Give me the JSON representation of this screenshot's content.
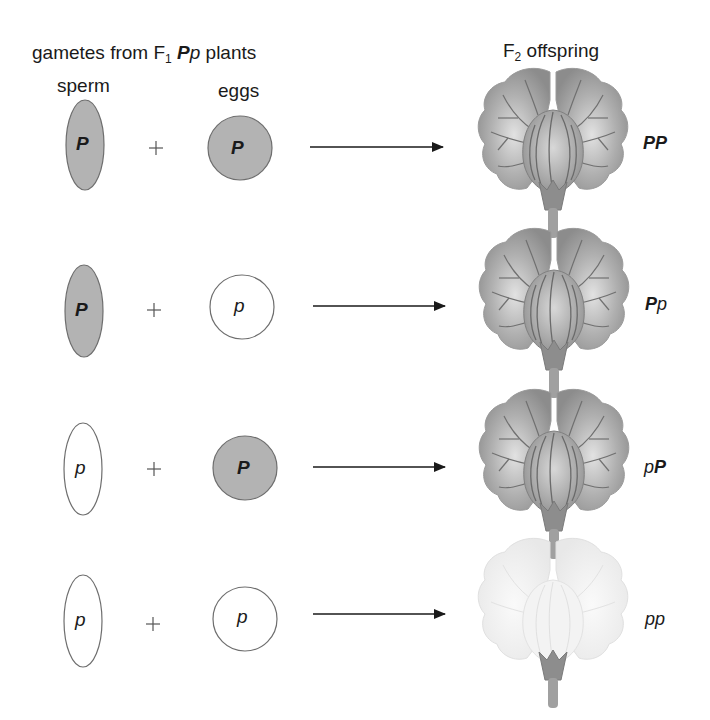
{
  "header": {
    "title_prefix": "gametes from F",
    "title_sub": "1",
    "title_allele_dominant": "P",
    "title_allele_recessive": "p",
    "title_suffix": "plants",
    "sperm_label": "sperm",
    "eggs_label": "eggs",
    "offspring_prefix": "F",
    "offspring_sub": "2",
    "offspring_suffix": "offspring"
  },
  "colors": {
    "dominant_fill": "#b3b3b3",
    "recessive_fill": "#ffffff",
    "outline": "#6e6e6e",
    "purple_flower": "#9a9a9a",
    "white_flower": "#ececec",
    "arrow": "#1a1a1a"
  },
  "rows": [
    {
      "sperm": "P",
      "sperm_dominant": true,
      "egg": "P",
      "egg_dominant": true,
      "plus": "+",
      "genotype": [
        {
          "a": "P",
          "dom": true
        },
        {
          "a": "P",
          "dom": true
        }
      ],
      "flower": "purple"
    },
    {
      "sperm": "P",
      "sperm_dominant": true,
      "egg": "p",
      "egg_dominant": false,
      "plus": "+",
      "genotype": [
        {
          "a": "P",
          "dom": true
        },
        {
          "a": "p",
          "dom": false
        }
      ],
      "flower": "purple"
    },
    {
      "sperm": "p",
      "sperm_dominant": false,
      "egg": "P",
      "egg_dominant": true,
      "plus": "+",
      "genotype": [
        {
          "a": "p",
          "dom": false
        },
        {
          "a": "P",
          "dom": true
        }
      ],
      "flower": "purple"
    },
    {
      "sperm": "p",
      "sperm_dominant": false,
      "egg": "p",
      "egg_dominant": false,
      "plus": "+",
      "genotype": [
        {
          "a": "p",
          "dom": false
        },
        {
          "a": "p",
          "dom": false
        }
      ],
      "flower": "white"
    }
  ]
}
